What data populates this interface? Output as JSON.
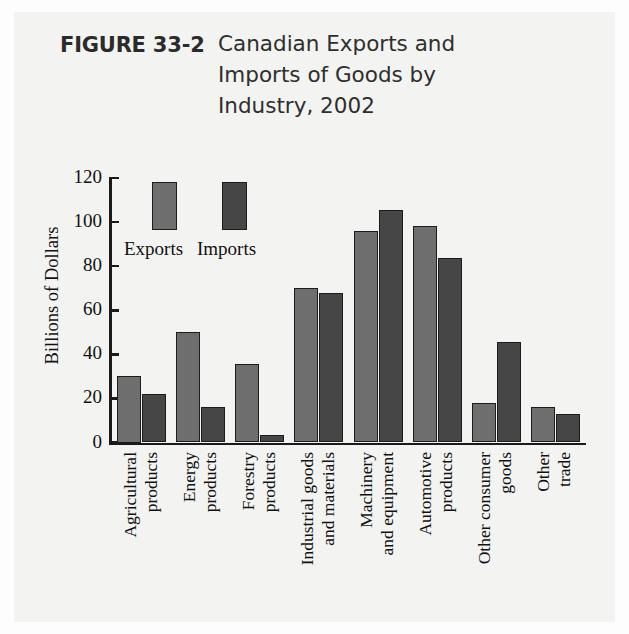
{
  "figure": {
    "label": "FIGURE 33-2",
    "title_lines": [
      "Canadian Exports and",
      "Imports of Goods by",
      "Industry, 2002"
    ]
  },
  "colors": {
    "exports": "#6e6e6e",
    "imports": "#464646",
    "axis": "#1a1a1a",
    "page_background": "#f3f3f1"
  },
  "chart_data": {
    "type": "bar",
    "title": "Canadian Exports and Imports of Goods by Industry, 2002",
    "xlabel": "",
    "ylabel": "Billions of Dollars",
    "ylim": [
      0,
      120
    ],
    "yticks": [
      0,
      20,
      40,
      60,
      80,
      100,
      120
    ],
    "ytick_labels": [
      "0",
      "20",
      "40",
      "60",
      "80",
      "100",
      "120"
    ],
    "grid": false,
    "legend_position": "upper-left-inside",
    "categories": [
      "Agricultural products",
      "Energy products",
      "Forestry products",
      "Industrial goods and materials",
      "Machinery and equipment",
      "Automotive products",
      "Other consumer goods",
      "Other trade"
    ],
    "category_label_lines": [
      [
        "Agricultural",
        "products"
      ],
      [
        "Energy",
        "products"
      ],
      [
        "Forestry",
        "products"
      ],
      [
        "Industrial goods",
        "and materials"
      ],
      [
        "Machinery",
        "and equipment"
      ],
      [
        "Automotive",
        "products"
      ],
      [
        "Other consumer",
        "goods"
      ],
      [
        "Other",
        "trade"
      ]
    ],
    "series": [
      {
        "name": "Exports",
        "values": [
          30,
          50,
          35.5,
          70,
          96,
          98,
          18,
          16
        ]
      },
      {
        "name": "Imports",
        "values": [
          22,
          16,
          3.5,
          68,
          105.5,
          83.5,
          45.5,
          13
        ]
      }
    ],
    "legend": [
      "Exports",
      "Imports"
    ]
  }
}
